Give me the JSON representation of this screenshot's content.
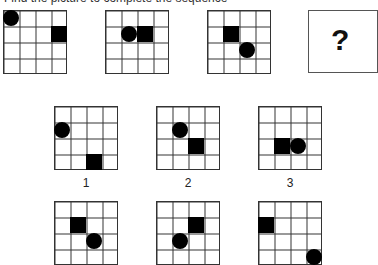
{
  "header": {
    "text": "Find the picture to complete the sequence"
  },
  "sequence": [
    {
      "id": "seq-1",
      "x": 3,
      "y": 10,
      "circle": [
        0,
        0
      ],
      "square": [
        3,
        1
      ]
    },
    {
      "id": "seq-2",
      "x": 105,
      "y": 10,
      "circle": [
        1,
        1
      ],
      "square": [
        2,
        1
      ]
    },
    {
      "id": "seq-3",
      "x": 207,
      "y": 10,
      "circle": [
        2,
        2
      ],
      "square": [
        1,
        1
      ]
    }
  ],
  "question": {
    "mark": "?"
  },
  "options": [
    {
      "label": "1",
      "x": 54,
      "y": 106,
      "circle": [
        0,
        1
      ],
      "square": [
        2,
        3
      ]
    },
    {
      "label": "2",
      "x": 156,
      "y": 106,
      "circle": [
        1,
        1
      ],
      "square": [
        2,
        2
      ]
    },
    {
      "label": "3",
      "x": 258,
      "y": 106,
      "circle": [
        2,
        2
      ],
      "square": [
        1,
        2
      ]
    },
    {
      "label": "4",
      "x": 54,
      "y": 201,
      "circle": [
        2,
        2
      ],
      "square": [
        1,
        1
      ]
    },
    {
      "label": "5",
      "x": 156,
      "y": 201,
      "circle": [
        1,
        2
      ],
      "square": [
        2,
        1
      ]
    },
    {
      "label": "6",
      "x": 258,
      "y": 201,
      "circle": [
        3,
        3
      ],
      "square": [
        0,
        1
      ]
    }
  ]
}
